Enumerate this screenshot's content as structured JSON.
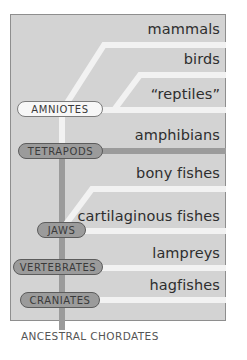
{
  "diagram": {
    "type": "cladogram",
    "root_label": "ANCESTRAL CHORDATES",
    "taxa": [
      {
        "id": "mammals",
        "label": "mammals"
      },
      {
        "id": "birds",
        "label": "birds"
      },
      {
        "id": "reptiles",
        "label": "“reptiles”"
      },
      {
        "id": "amphibians",
        "label": "amphibians"
      },
      {
        "id": "bony-fishes",
        "label": "bony fishes"
      },
      {
        "id": "cartilaginous-fishes",
        "label": "cartilaginous fishes"
      },
      {
        "id": "lampreys",
        "label": "lampreys"
      },
      {
        "id": "hagfishes",
        "label": "hagfishes"
      }
    ],
    "clades": [
      {
        "id": "amniotes",
        "label": "AMNIOTES",
        "style": "light"
      },
      {
        "id": "tetrapods",
        "label": "TETRAPODS",
        "style": "dark"
      },
      {
        "id": "jaws",
        "label": "JAWS",
        "style": "dark"
      },
      {
        "id": "vertebrates",
        "label": "VERTEBRATES",
        "style": "dark"
      },
      {
        "id": "craniates",
        "label": "CRANIATES",
        "style": "dark"
      }
    ],
    "colors": {
      "panel_bg": "#d3d3d3",
      "panel_border": "#8e8e8e",
      "light_branch": "#f2f2f2",
      "dark_branch": "#9b9b9b",
      "text": "#2e2e2e"
    }
  }
}
